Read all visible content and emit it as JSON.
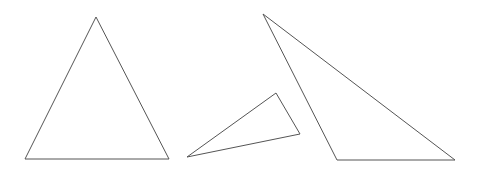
{
  "canvas": {
    "width": 480,
    "height": 173,
    "background": "#ffffff"
  },
  "stroke_color": "#555555",
  "shapes": [
    {
      "name": "triangle-isosceles",
      "points": "96,17 25,159 169,159"
    },
    {
      "name": "triangle-small-obtuse",
      "points": "187,157 276,93 300,134"
    },
    {
      "name": "triangle-large-scalene",
      "points": "263,14 337,160 455,160"
    }
  ]
}
